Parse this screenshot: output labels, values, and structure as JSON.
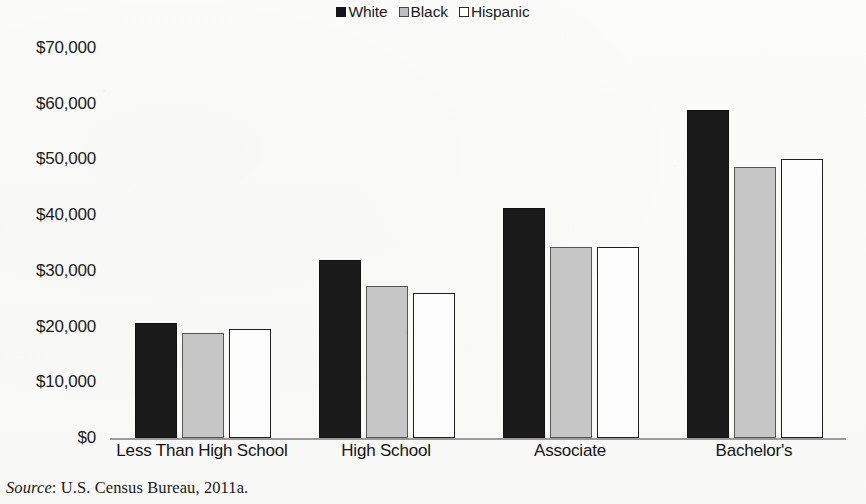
{
  "chart_data": {
    "type": "bar",
    "title": "",
    "subtitle": "",
    "xlabel": "",
    "ylabel": "",
    "categories": [
      "Less Than High School",
      "High School",
      "Associate",
      "Bachelor's"
    ],
    "series": [
      {
        "name": "White",
        "values": [
          20700,
          32000,
          41300,
          58800
        ],
        "color": "#1a1a1a",
        "swatch": "filled-black"
      },
      {
        "name": "Black",
        "values": [
          18900,
          27200,
          34300,
          48700
        ],
        "color": "#c6c6c6",
        "swatch": "filled-gray"
      },
      {
        "name": "Hispanic",
        "values": [
          19600,
          26100,
          34300,
          50000
        ],
        "color": "#ffffff",
        "swatch": "outlined-white"
      }
    ],
    "ylim": [
      0,
      70000
    ],
    "ytick_values": [
      70000,
      60000,
      50000,
      40000,
      30000,
      20000,
      10000,
      0
    ],
    "ytick_labels": [
      "$70,000",
      "$60,000",
      "$50,000",
      "$40,000",
      "$30,000",
      "$20,000",
      "$10,000",
      "$0"
    ],
    "grid": false,
    "legend_position": "top-center",
    "axis_line_color": "#9a9a9a"
  },
  "legend": {
    "entries": [
      {
        "label": "White",
        "swatch_name": "legend-swatch-white"
      },
      {
        "label": "Black",
        "swatch_name": "legend-swatch-black"
      },
      {
        "label": "Hispanic",
        "swatch_name": "legend-swatch-hispanic"
      }
    ]
  },
  "axes": {
    "y_labels": [
      "$70,000",
      "$60,000",
      "$50,000",
      "$40,000",
      "$30,000",
      "$20,000",
      "$10,000",
      "$0"
    ],
    "x_labels": [
      "Less Than High School",
      "High School",
      "Associate",
      "Bachelor's"
    ]
  },
  "footer": {
    "source_word": "Source",
    "source_text": ": U.S. Census Bureau, 2011a."
  }
}
